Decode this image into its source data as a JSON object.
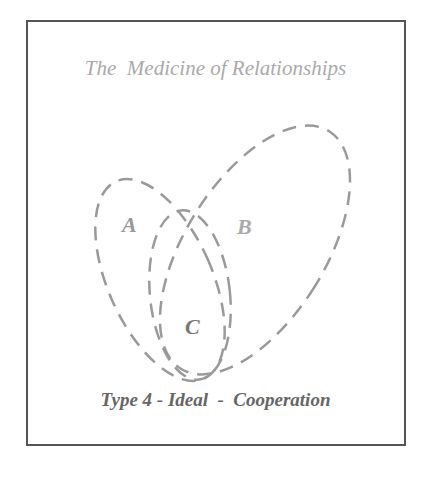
{
  "diagram": {
    "title": "The  Medicine of Relationships",
    "caption": "Type 4 - Ideal  -  Cooperation",
    "sets": [
      {
        "label": "A",
        "color": "#999999"
      },
      {
        "label": "B",
        "color": "#aaaaaa"
      },
      {
        "label": "C",
        "color": "#777777"
      }
    ],
    "colors": {
      "frame": "#555555",
      "title": "#aaaaaa",
      "caption": "#666666",
      "outline": "#999999"
    }
  }
}
